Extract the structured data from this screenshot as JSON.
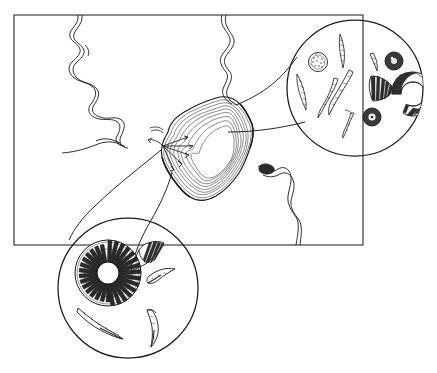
{
  "figure": {
    "kind": "scientific line drawing",
    "background_color": "#ffffff",
    "ink_color": "#1a1a1a",
    "width": 437,
    "height": 373,
    "caption": "",
    "labels": []
  },
  "map_frame": {
    "name": "map-border",
    "shape": "rectangle",
    "x": 14,
    "y": 15,
    "width": 349,
    "height": 230,
    "stroke": "#1a1a1a",
    "stroke_width": 1.05
  },
  "landform": {
    "name": "shaded-landmass",
    "description": "irregular elongated shaded landmass with contour hatching running diagonally across the centre of the map",
    "center_x": 205,
    "center_y": 148,
    "shading": "fine parallel contour hatching following the outline",
    "arrows": {
      "count": 6,
      "origin_x": 163,
      "origin_y": 146,
      "description": "radiating arrows fanning out to the right from the western margin of the landmass"
    }
  },
  "rivers": [
    {
      "name": "river-northwest",
      "description": "meandering double-line stream descending from the top border toward the landmass",
      "entry_x": 78,
      "entry_y": 15
    },
    {
      "name": "river-north-central",
      "description": "meandering double-line stream descending from the top border into the north edge of the landmass",
      "entry_x": 222,
      "entry_y": 15
    },
    {
      "name": "river-west-tributary",
      "description": "short tributary entering from the left frame edge",
      "entry_x": 62,
      "entry_y": 153
    },
    {
      "name": "river-southeast",
      "description": "double-line stream leaving the landmass and running south to the bottom border",
      "exit_x": 292,
      "exit_y": 245
    }
  ],
  "insets": [
    {
      "name": "inset-upper-right",
      "label": "",
      "center_x": 355,
      "center_y": 88,
      "radius": 68,
      "anchor_x": 238,
      "anchor_y": 130,
      "leader": "cone",
      "specimen_count": 12,
      "specimens": [
        {
          "type": "centric-diatom",
          "shape": "stippled disc"
        },
        {
          "type": "centric-diatom",
          "shape": "stippled disc"
        },
        {
          "type": "centric-diatom",
          "shape": "stippled disc"
        },
        {
          "type": "pennate-diatom",
          "shape": "needle spindle"
        },
        {
          "type": "pennate-diatom",
          "shape": "needle spindle"
        },
        {
          "type": "pennate-diatom",
          "shape": "needle spindle"
        },
        {
          "type": "pennate-diatom",
          "shape": "needle spindle"
        },
        {
          "type": "pennate-diatom",
          "shape": "needle spindle"
        },
        {
          "type": "pennate-diatom",
          "shape": "curved sickle"
        },
        {
          "type": "pennate-diatom",
          "shape": "curved sickle"
        },
        {
          "type": "fan-diatom",
          "shape": "striated wedge fan"
        },
        {
          "type": "horseshoe-diatom",
          "shape": "striated C-ring"
        }
      ]
    },
    {
      "name": "inset-lower-left",
      "label": "",
      "center_x": 128,
      "center_y": 288,
      "radius": 70,
      "anchor_x": 160,
      "anchor_y": 150,
      "leader": "cone",
      "specimen_count": 5,
      "specimens": [
        {
          "type": "radial-centric-diatom",
          "shape": "rayed annulus with open centre"
        },
        {
          "type": "fan-diatom",
          "shape": "striated trumpet wedge"
        },
        {
          "type": "pennate-diatom",
          "shape": "curved sickle"
        },
        {
          "type": "pennate-diatom",
          "shape": "curved sickle"
        },
        {
          "type": "pennate-diatom",
          "shape": "bent needle"
        }
      ]
    }
  ]
}
